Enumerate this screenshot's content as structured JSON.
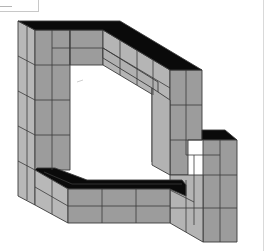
{
  "figure": {
    "colors": {
      "top_face": "#0a0a0a",
      "front_face": "#9a9a9a",
      "side_face": "#b8b8b8",
      "grid_line": "#3a3a3a",
      "background": "#ffffff"
    },
    "caption": ""
  }
}
